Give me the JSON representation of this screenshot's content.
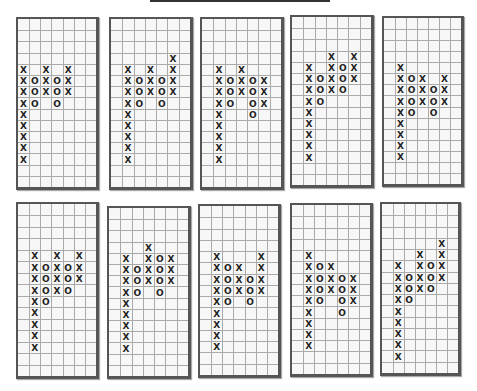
{
  "chart_data": [
    {
      "type": "point-and-figure",
      "title": "",
      "grid": {
        "columns": 7,
        "rows": 15
      },
      "columns": [
        {
          "col": 0,
          "symbol": "X",
          "from_row": 4,
          "to_row": 12
        },
        {
          "col": 1,
          "symbol": "O",
          "from_row": 5,
          "to_row": 7
        },
        {
          "col": 2,
          "symbol": "X",
          "from_row": 4,
          "to_row": 6
        },
        {
          "col": 3,
          "symbol": "O",
          "from_row": 5,
          "to_row": 7
        },
        {
          "col": 4,
          "symbol": "X",
          "from_row": 4,
          "to_row": 6
        }
      ]
    },
    {
      "type": "point-and-figure",
      "title": "",
      "grid": {
        "columns": 7,
        "rows": 15
      },
      "columns": [
        {
          "col": 1,
          "symbol": "X",
          "from_row": 4,
          "to_row": 12
        },
        {
          "col": 2,
          "symbol": "O",
          "from_row": 5,
          "to_row": 7
        },
        {
          "col": 3,
          "symbol": "X",
          "from_row": 4,
          "to_row": 6
        },
        {
          "col": 4,
          "symbol": "O",
          "from_row": 5,
          "to_row": 7
        },
        {
          "col": 5,
          "symbol": "X",
          "from_row": 3,
          "to_row": 6
        }
      ]
    },
    {
      "type": "point-and-figure",
      "title": "",
      "grid": {
        "columns": 7,
        "rows": 15
      },
      "columns": [
        {
          "col": 1,
          "symbol": "X",
          "from_row": 4,
          "to_row": 12
        },
        {
          "col": 2,
          "symbol": "O",
          "from_row": 5,
          "to_row": 7
        },
        {
          "col": 3,
          "symbol": "X",
          "from_row": 4,
          "to_row": 6
        },
        {
          "col": 4,
          "symbol": "O",
          "from_row": 5,
          "to_row": 8
        },
        {
          "col": 5,
          "symbol": "X",
          "from_row": 5,
          "to_row": 7
        }
      ]
    },
    {
      "type": "point-and-figure",
      "title": "",
      "grid": {
        "columns": 7,
        "rows": 15
      },
      "columns": [
        {
          "col": 1,
          "symbol": "X",
          "from_row": 4,
          "to_row": 12
        },
        {
          "col": 2,
          "symbol": "O",
          "from_row": 5,
          "to_row": 7
        },
        {
          "col": 3,
          "symbol": "X",
          "from_row": 3,
          "to_row": 6
        },
        {
          "col": 4,
          "symbol": "O",
          "from_row": 4,
          "to_row": 6
        },
        {
          "col": 5,
          "symbol": "X",
          "from_row": 3,
          "to_row": 5
        }
      ]
    },
    {
      "type": "point-and-figure",
      "title": "",
      "grid": {
        "columns": 7,
        "rows": 15
      },
      "columns": [
        {
          "col": 1,
          "symbol": "X",
          "from_row": 4,
          "to_row": 12
        },
        {
          "col": 2,
          "symbol": "O",
          "from_row": 5,
          "to_row": 8
        },
        {
          "col": 3,
          "symbol": "X",
          "from_row": 5,
          "to_row": 7
        },
        {
          "col": 4,
          "symbol": "O",
          "from_row": 6,
          "to_row": 8
        },
        {
          "col": 5,
          "symbol": "X",
          "from_row": 5,
          "to_row": 7
        }
      ]
    },
    {
      "type": "point-and-figure",
      "title": "",
      "grid": {
        "columns": 7,
        "rows": 15
      },
      "columns": [
        {
          "col": 1,
          "symbol": "X",
          "from_row": 4,
          "to_row": 12
        },
        {
          "col": 2,
          "symbol": "O",
          "from_row": 5,
          "to_row": 8
        },
        {
          "col": 3,
          "symbol": "X",
          "from_row": 4,
          "to_row": 7
        },
        {
          "col": 4,
          "symbol": "O",
          "from_row": 5,
          "to_row": 7
        },
        {
          "col": 5,
          "symbol": "X",
          "from_row": 4,
          "to_row": 6
        }
      ]
    },
    {
      "type": "point-and-figure",
      "title": "",
      "grid": {
        "columns": 7,
        "rows": 15
      },
      "columns": [
        {
          "col": 1,
          "symbol": "X",
          "from_row": 4,
          "to_row": 12
        },
        {
          "col": 2,
          "symbol": "O",
          "from_row": 5,
          "to_row": 7
        },
        {
          "col": 3,
          "symbol": "X",
          "from_row": 3,
          "to_row": 6
        },
        {
          "col": 4,
          "symbol": "O",
          "from_row": 4,
          "to_row": 7
        },
        {
          "col": 5,
          "symbol": "X",
          "from_row": 4,
          "to_row": 6
        }
      ]
    },
    {
      "type": "point-and-figure",
      "title": "",
      "grid": {
        "columns": 7,
        "rows": 15
      },
      "columns": [
        {
          "col": 1,
          "symbol": "X",
          "from_row": 4,
          "to_row": 12
        },
        {
          "col": 2,
          "symbol": "O",
          "from_row": 5,
          "to_row": 8
        },
        {
          "col": 3,
          "symbol": "X",
          "from_row": 5,
          "to_row": 7
        },
        {
          "col": 4,
          "symbol": "O",
          "from_row": 6,
          "to_row": 8
        },
        {
          "col": 5,
          "symbol": "X",
          "from_row": 4,
          "to_row": 7
        }
      ]
    },
    {
      "type": "point-and-figure",
      "title": "",
      "grid": {
        "columns": 7,
        "rows": 15
      },
      "columns": [
        {
          "col": 1,
          "symbol": "X",
          "from_row": 4,
          "to_row": 12
        },
        {
          "col": 2,
          "symbol": "O",
          "from_row": 5,
          "to_row": 8
        },
        {
          "col": 3,
          "symbol": "X",
          "from_row": 5,
          "to_row": 7
        },
        {
          "col": 4,
          "symbol": "O",
          "from_row": 6,
          "to_row": 9
        },
        {
          "col": 5,
          "symbol": "X",
          "from_row": 6,
          "to_row": 8
        }
      ]
    },
    {
      "type": "point-and-figure",
      "title": "",
      "grid": {
        "columns": 7,
        "rows": 15
      },
      "columns": [
        {
          "col": 1,
          "symbol": "X",
          "from_row": 5,
          "to_row": 13
        },
        {
          "col": 2,
          "symbol": "O",
          "from_row": 6,
          "to_row": 8
        },
        {
          "col": 3,
          "symbol": "X",
          "from_row": 4,
          "to_row": 7
        },
        {
          "col": 4,
          "symbol": "O",
          "from_row": 5,
          "to_row": 7
        },
        {
          "col": 5,
          "symbol": "X",
          "from_row": 3,
          "to_row": 6
        }
      ]
    }
  ]
}
